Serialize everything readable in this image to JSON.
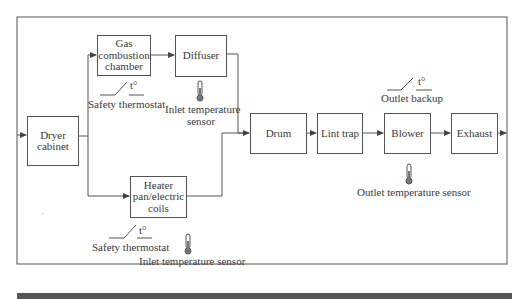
{
  "diagram": {
    "type": "flow",
    "colors": {
      "line": "#555555",
      "text": "#3a3a3a",
      "thermometer": "#666666"
    },
    "nodes": {
      "dryer_cabinet": "Dryer cabinet",
      "gas_chamber": "Gas combustion chamber",
      "diffuser": "Diffuser",
      "heater": "Heater pan/electric coils",
      "drum": "Drum",
      "lint_trap": "Lint trap",
      "blower": "Blower",
      "exhaust": "Exhaust"
    },
    "node_lines": {
      "dryer_cabinet": [
        "Dryer",
        "cabinet"
      ],
      "gas_chamber": [
        "Gas",
        "combustion",
        "chamber"
      ],
      "heater": [
        "Heater",
        "pan/electric",
        "coils"
      ]
    },
    "annotations": {
      "gas_safety_symbol": "t°",
      "gas_safety_label": "Safety thermostat",
      "diffuser_sensor_label": [
        "Inlet temperature",
        "sensor"
      ],
      "heater_safety_symbol": "t°",
      "heater_safety_label": "Safety thermostat",
      "heater_sensor_label": "Inlet temperature sensor",
      "outlet_backup_symbol": "t°",
      "outlet_backup_label": "Outlet backup",
      "outlet_sensor_label": "Outlet temperature sensor"
    },
    "edges": [
      [
        "dryer_cabinet",
        "gas_chamber"
      ],
      [
        "dryer_cabinet",
        "heater"
      ],
      [
        "gas_chamber",
        "diffuser"
      ],
      [
        "diffuser",
        "drum"
      ],
      [
        "heater",
        "drum"
      ],
      [
        "drum",
        "lint_trap"
      ],
      [
        "lint_trap",
        "blower"
      ],
      [
        "blower",
        "exhaust"
      ],
      [
        "exhaust",
        "dryer_cabinet"
      ]
    ]
  }
}
